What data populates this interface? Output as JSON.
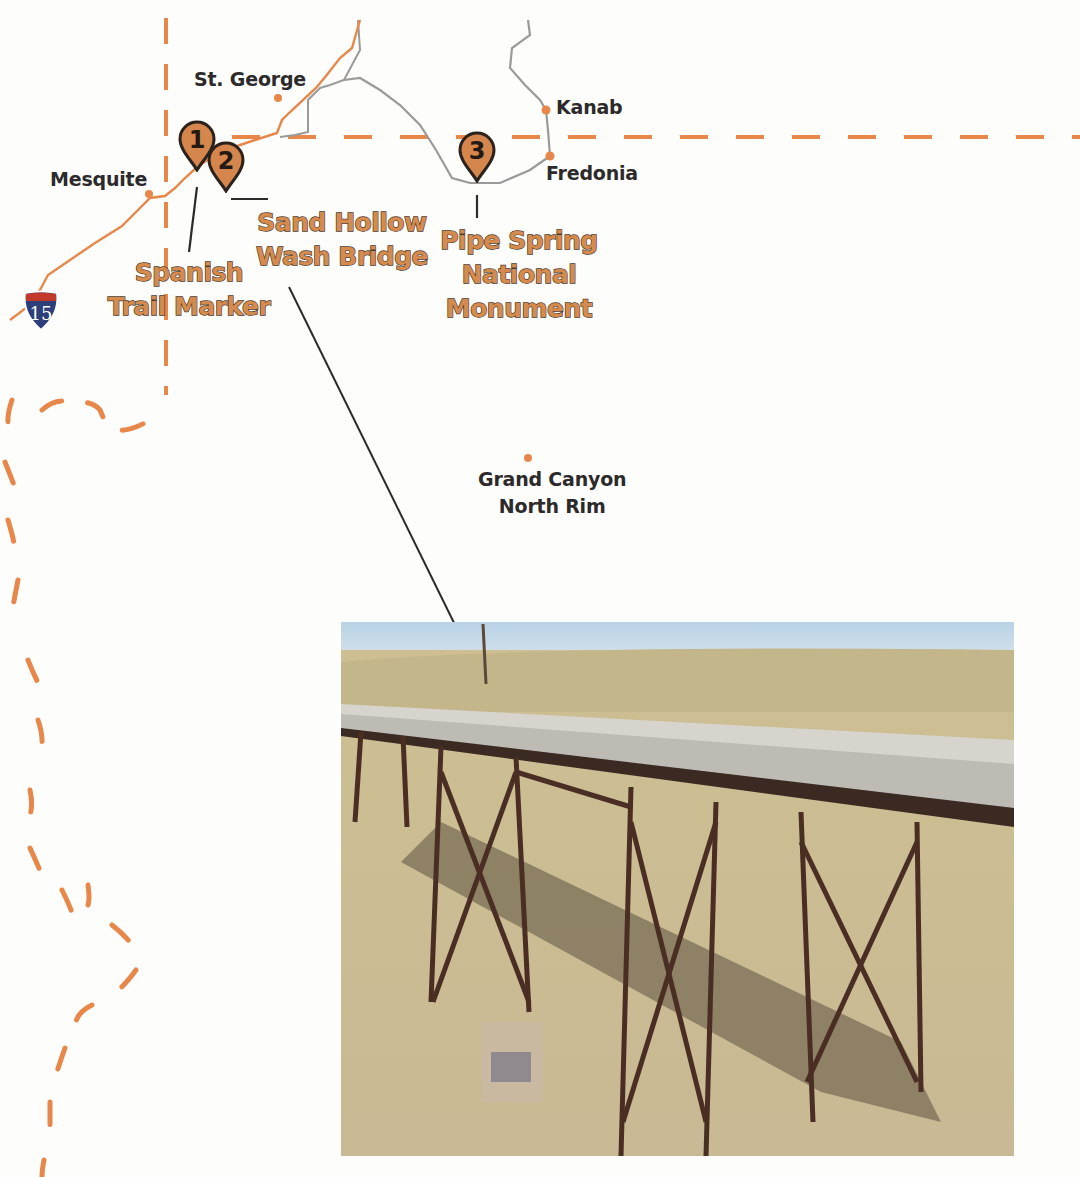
{
  "map": {
    "colors": {
      "route_orange": "#e8874a",
      "road_gray": "#9a9a9a",
      "marker_fill": "#d5864c",
      "marker_stroke": "#2b221b",
      "label_text": "#2c2a2a",
      "poi_text": "#d58a4e",
      "background": "#fdfdfc"
    },
    "cities": [
      {
        "name": "St. George"
      },
      {
        "name": "Mesquite"
      },
      {
        "name": "Kanab"
      },
      {
        "name": "Fredonia"
      },
      {
        "name": "Grand Canyon",
        "name_line2": "North Rim"
      }
    ],
    "markers": [
      {
        "number": "1",
        "label_line1": "Spanish",
        "label_line2": "Trail Marker"
      },
      {
        "number": "2",
        "label_line1": "Sand Hollow",
        "label_line2": "Wash Bridge"
      },
      {
        "number": "3",
        "label_line1": "Pipe Spring",
        "label_line2": "National",
        "label_line3": "Monument"
      }
    ],
    "highway_shield": {
      "type": "Interstate",
      "number": "15"
    },
    "photo": {
      "subject": "Sand Hollow Wash Bridge - steel trestle bridge over desert canyon"
    }
  }
}
